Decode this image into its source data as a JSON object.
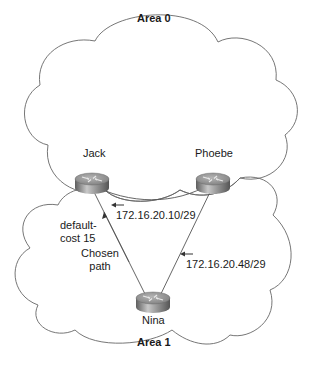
{
  "areas": [
    {
      "id": "area0",
      "label": "Area 0"
    },
    {
      "id": "area1",
      "label": "Area 1"
    }
  ],
  "routers": [
    {
      "id": "jack",
      "label": "Jack",
      "icon": "router-icon"
    },
    {
      "id": "phoebe",
      "label": "Phoebe",
      "icon": "router-icon"
    },
    {
      "id": "nina",
      "label": "Nina",
      "icon": "router-icon"
    }
  ],
  "links": [
    {
      "from": "jack",
      "to": "phoebe",
      "label": ""
    },
    {
      "from": "nina",
      "to": "jack",
      "label": "172.16.20.10/29"
    },
    {
      "from": "nina",
      "to": "phoebe",
      "label": "172.16.20.48/29"
    }
  ],
  "annotations": {
    "default_cost_line1": "default-",
    "default_cost_line2": "cost 15",
    "chosen_path_line1": "Chosen",
    "chosen_path_line2": "path"
  },
  "colors": {
    "line": "#555555",
    "cloud_stroke": "#666666",
    "router_top": "#9a9a9a",
    "router_side": "#7a7a7a",
    "text": "#1a1a1a"
  }
}
